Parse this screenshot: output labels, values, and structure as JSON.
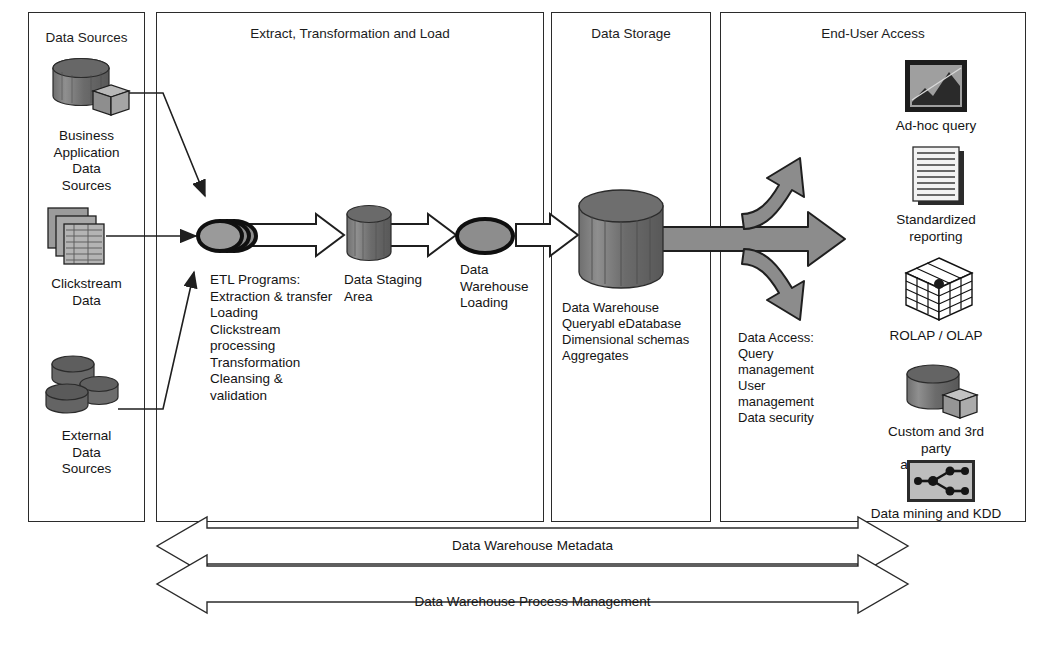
{
  "diagram": {
    "panels": [
      {
        "id": "data-sources",
        "title": "Data Sources"
      },
      {
        "id": "etl",
        "title": "Extract, Transformation and Load"
      },
      {
        "id": "data-storage",
        "title": "Data Storage"
      },
      {
        "id": "end-user-access",
        "title": "End-User Access"
      }
    ],
    "sources": [
      {
        "icon": "database-cube-icon",
        "label": "Business\nApplication\nData\nSources"
      },
      {
        "icon": "stacked-tables-icon",
        "label": "Clickstream\nData"
      },
      {
        "icon": "multiple-disks-icon",
        "label": "External\nData\nSources"
      }
    ],
    "etl": {
      "process_icon": "stacked-ellipses-icon",
      "programs": "ETL Programs:\nExtraction & transfer\nLoading\nClickstream\nprocessing\nTransformation\nCleansing &\nvalidation",
      "staging_icon": "cylinder-icon",
      "staging_label": "Data Staging\nArea",
      "loading_icon": "ellipse-icon",
      "loading_label": "Data\nWarehouse\nLoading"
    },
    "storage": {
      "icon": "large-cylinder-icon",
      "label": "Data Warehouse\nQueryabl eDatabase\nDimensional schemas\nAggregates",
      "access_label": "Data Access:\nQuery\nmanagement\nUser\nmanagement\nData security"
    },
    "end_user": [
      {
        "icon": "chart-query-icon",
        "label": "Ad-hoc query"
      },
      {
        "icon": "report-pages-icon",
        "label": "Standardized\nreporting"
      },
      {
        "icon": "olap-cube-icon",
        "label": "ROLAP / OLAP"
      },
      {
        "icon": "database-cube-icon",
        "label": "Custom and 3rd\nparty\napplications"
      },
      {
        "icon": "data-mining-graph-icon",
        "label": "Data mining and KDD"
      }
    ],
    "bottom_bars": [
      {
        "id": "metadata-arrow",
        "label": "Data Warehouse Metadata"
      },
      {
        "id": "process-management-arrow",
        "label": "Data Warehouse Process Management"
      }
    ],
    "colors": {
      "outline": "#2b2b2b",
      "fill_gray": "#8a8a8a",
      "fill_dark": "#5b5b5b",
      "fill_light": "#c9c9c9",
      "white": "#ffffff"
    }
  }
}
